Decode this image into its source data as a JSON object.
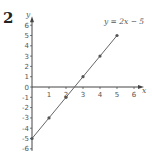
{
  "question_number": "2",
  "chart_data": {
    "type": "line",
    "title": "",
    "equation_label": "y = 2x − 5",
    "xlabel": "x",
    "ylabel": "y",
    "x_ticks": [
      1,
      2,
      3,
      4,
      5,
      6
    ],
    "y_ticks": [
      6,
      5,
      4,
      3,
      2,
      1,
      0,
      -1,
      -2,
      -3,
      -4,
      -5,
      -6
    ],
    "xlim": [
      0,
      6
    ],
    "ylim": [
      -6,
      6
    ],
    "grid": false,
    "series": [
      {
        "name": "y = 2x − 5",
        "x": [
          0,
          1,
          2,
          3,
          4,
          5
        ],
        "y": [
          -5,
          -3,
          -1,
          1,
          3,
          5
        ],
        "markers": true
      }
    ],
    "colors": {
      "line": "#666666",
      "axis": "#444444",
      "marker": "#555555"
    }
  }
}
